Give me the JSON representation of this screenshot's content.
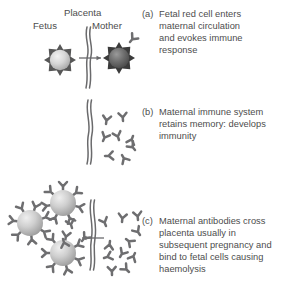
{
  "figure": {
    "background_color": "#ffffff",
    "text_color": "#4d4d4d",
    "line_color": "#58585a",
    "cell_fill_light": "#d8d8d8",
    "cell_fill_dark": "#6f6f6f",
    "antibody_color": "#6e6e70"
  },
  "labels": {
    "fetus": "Fetus",
    "placenta": "Placenta",
    "mother": "Mother"
  },
  "panels": [
    {
      "tag": "(a)",
      "text": "Fetal red cell enters\nmaternal circulation\nand evokes immune\nresponse",
      "cells": 2,
      "antibodies": 1
    },
    {
      "tag": "(b)",
      "text": "Maternal immune system\nretains memory: develops\nimmunity",
      "cells": 0,
      "antibodies": 8
    },
    {
      "tag": "(c)",
      "text": "Maternal antibodies cross\nplacenta usually in\nsubsequent pregnancy and\nbind to fetal cells causing\nhaemolysis",
      "cells": 3,
      "antibodies": 24
    }
  ],
  "icons": {
    "placenta_barrier": "wavy-double-line",
    "transfer_arrow": "arrow-right",
    "antibody": "y-shaped-antibody",
    "red_cell": "spiky-red-blood-cell"
  }
}
